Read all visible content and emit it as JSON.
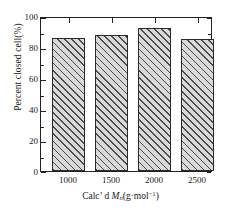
{
  "chart_data": {
    "type": "bar",
    "title": "",
    "xlabel": "Calc' d Mn(g·mol−1)",
    "ylabel": "Percent closed cell(%)",
    "categories": [
      "1000",
      "1500",
      "2000",
      "2500"
    ],
    "values": [
      86,
      88,
      92,
      85
    ],
    "ylim": [
      0,
      100
    ],
    "ytick_labels": [
      "0",
      "20",
      "40",
      "60",
      "80",
      "100"
    ],
    "ytick_values": [
      0,
      20,
      40,
      60,
      80,
      100
    ],
    "yminor_interval": 5,
    "grid": false,
    "legend": null,
    "series": [
      {
        "name": "Percent closed cell",
        "values": [
          86,
          88,
          92,
          85
        ]
      }
    ],
    "bar_fill_color": "#d9d9d9",
    "bar_hatch_color": "#4a4a4a",
    "bar_edge_color": "#2a2a2a",
    "hatch_pattern": "diagonal-45",
    "axis_color": "#222222",
    "background_color": "#ffffff"
  },
  "xaxis_title_parts": {
    "prefix": "Calc",
    "prime": "’",
    "d": " d ",
    "symbol": "M",
    "subscript": "n",
    "units_open": "(g·mol",
    "units_exponent": "−1",
    "units_close": ")"
  }
}
